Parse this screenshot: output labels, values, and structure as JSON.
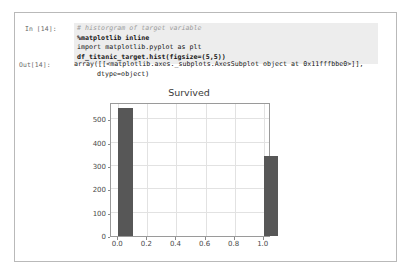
{
  "notebook": {
    "input_prompt": "In [14]:",
    "output_prompt": "Out[14]:",
    "code_lines": [
      "# historgram of target variable",
      "%matplotlib inline",
      "import matplotlib.pyplot as plt",
      "df_titanic_target.hist(figsize=(5,5))"
    ],
    "output_lines": [
      "array([[<matplotlib.axes._subplots.AxesSubplot object at 0x11fffbbe0>]],",
      "dtype=object)"
    ],
    "colors": {
      "code_background": "#ededed",
      "frame_border": "#b9b9b9",
      "prompt_text": "#6a6a6a",
      "comment_text": "#9b9b9b"
    }
  },
  "chart_data": {
    "type": "bar",
    "title": "Survived",
    "xlabel": "",
    "ylabel": "",
    "categories": [
      "0.0",
      "1.0"
    ],
    "x": [
      0.0,
      1.0
    ],
    "values": [
      549,
      342
    ],
    "bar_width": 0.1,
    "xlim": [
      -0.05,
      1.05
    ],
    "ylim": [
      0,
      575
    ],
    "xticks": [
      "0.0",
      "0.2",
      "0.4",
      "0.6",
      "0.8",
      "1.0"
    ],
    "xtick_values": [
      0.0,
      0.2,
      0.4,
      0.6,
      0.8,
      1.0
    ],
    "yticks": [
      "0",
      "100",
      "200",
      "300",
      "400",
      "500"
    ],
    "ytick_values": [
      0,
      100,
      200,
      300,
      400,
      500
    ],
    "grid": true,
    "legend": false,
    "bar_color": "#575757",
    "grid_color": "#e2e2e2"
  }
}
